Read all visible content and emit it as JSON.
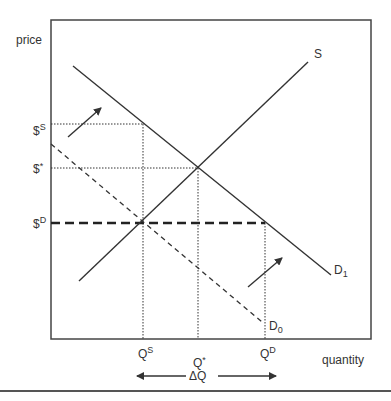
{
  "diagram": {
    "type": "supply-demand-price-control",
    "axis_labels": {
      "y": "price",
      "x": "quantity"
    },
    "curves": {
      "supply": {
        "label": "S"
      },
      "demand_new": {
        "label_main": "D",
        "label_sub": "1"
      },
      "demand_old": {
        "label_main": "D",
        "label_sub": "0"
      }
    },
    "price_levels": {
      "supply_price": {
        "main": "$",
        "sup": "S"
      },
      "equilibrium_price": {
        "main": "$",
        "sup": "*"
      },
      "demand_price": {
        "main": "$",
        "sup": "D"
      }
    },
    "quantity_levels": {
      "supply_qty": {
        "main": "Q",
        "sup": "S"
      },
      "equilibrium_qty": {
        "main": "Q",
        "sup": "*"
      },
      "demand_qty": {
        "main": "Q",
        "sup": "D"
      }
    },
    "gap_label": "ΔQ",
    "colors": {
      "line": "#333333",
      "frame": "#444444",
      "background": "#ffffff"
    }
  }
}
